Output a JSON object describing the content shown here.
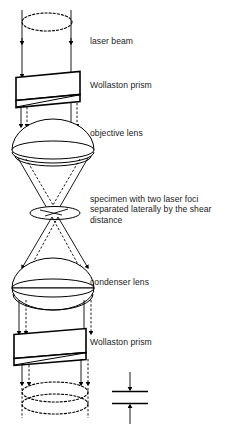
{
  "diagram": {
    "labels": [
      {
        "id": "laser-beam",
        "text": "laser beam",
        "x": 90,
        "y": 41
      },
      {
        "id": "wollaston-top",
        "text": "Wollaston prism",
        "x": 90,
        "y": 85
      },
      {
        "id": "objective-lens",
        "text": "objective lens",
        "x": 90,
        "y": 133
      },
      {
        "id": "specimen",
        "text": "specimen with two laser foci\nseparated laterally by the shear\ndistance",
        "x": 90,
        "y": 200
      },
      {
        "id": "condenser-lens",
        "text": "condenser lens",
        "x": 90,
        "y": 281
      },
      {
        "id": "wollaston-bot",
        "text": "Wollaston prism",
        "x": 90,
        "y": 341
      }
    ],
    "components": [
      {
        "id": "top-dashed-ellipse",
        "type": "ellipse-dashed",
        "cx": 47,
        "cy": 22,
        "rx": 33,
        "ry": 10
      },
      {
        "id": "top-wollaston-prism",
        "type": "prism",
        "cy": 87
      },
      {
        "id": "objective-lens-shape",
        "type": "lens-plano",
        "cy": 140
      },
      {
        "id": "specimen-disk",
        "type": "disk",
        "cx": 55,
        "cy": 213,
        "rx": 25,
        "ry": 6
      },
      {
        "id": "condenser-lens-shape",
        "type": "lens-biconvex",
        "cy": 286
      },
      {
        "id": "bottom-wollaston-prism",
        "type": "prism",
        "cy": 345
      },
      {
        "id": "bottom-dashed-ellipse-1",
        "type": "ellipse-dashed",
        "cx": 55,
        "cy": 392,
        "rx": 33,
        "ry": 10
      },
      {
        "id": "bottom-dashed-ellipse-2",
        "type": "ellipse-dashed",
        "cx": 55,
        "cy": 402,
        "rx": 33,
        "ry": 10
      }
    ],
    "shear_indicator": {
      "id": "shear-distance-indicator",
      "x_center": 130,
      "line_top_y": 391,
      "line_bottom_y": 403,
      "line_half_width": 18,
      "arrow_top_from_y": 372,
      "arrow_bottom_from_y": 424
    },
    "colors": {
      "stroke": "#000000",
      "background": "#ffffff",
      "text": "#1a1a1a"
    }
  }
}
